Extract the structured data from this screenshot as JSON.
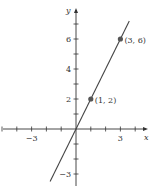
{
  "chart_data": {
    "type": "line",
    "title": "",
    "xlabel": "x",
    "ylabel": "y",
    "xlim": [
      -5,
      5
    ],
    "ylim": [
      -3.5,
      7.5
    ],
    "grid": false,
    "x_ticks": [
      -5,
      -4,
      -3,
      -2,
      -1,
      1,
      2,
      3,
      4
    ],
    "x_tick_labels": [
      {
        "value": -3,
        "label": "−3"
      },
      {
        "value": 3,
        "label": "3"
      }
    ],
    "y_ticks": [
      -3,
      -2,
      -1,
      1,
      2,
      3,
      4,
      5,
      6,
      7
    ],
    "y_tick_labels": [
      {
        "value": -3,
        "label": "−3"
      },
      {
        "value": 2,
        "label": "2"
      },
      {
        "value": 4,
        "label": "4"
      },
      {
        "value": 6,
        "label": "6"
      }
    ],
    "series": [
      {
        "name": "y = 2x",
        "equation": "y = 2x",
        "x": [
          -1.75,
          3.6
        ],
        "y": [
          -3.5,
          7.2
        ]
      }
    ],
    "points": [
      {
        "x": 1,
        "y": 2,
        "label": "(1, 2)"
      },
      {
        "x": 3,
        "y": 6,
        "label": "(3, 6)"
      }
    ]
  },
  "colors": {
    "axis": "#333333",
    "line": "#444444",
    "point": "#555555"
  }
}
